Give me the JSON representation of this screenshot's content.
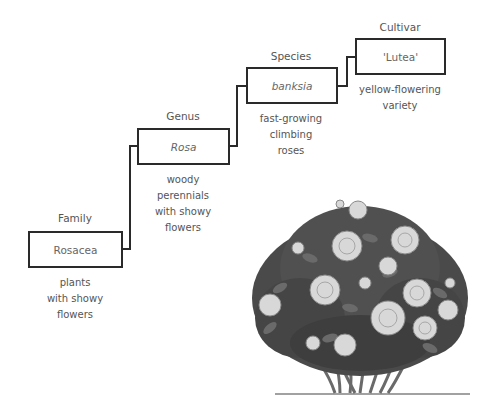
{
  "diagram": {
    "levels": [
      {
        "rank": "Family",
        "name": "Rosacea",
        "italic": false,
        "description": [
          "plants",
          "with showy",
          "flowers"
        ]
      },
      {
        "rank": "Genus",
        "name": "Rosa",
        "italic": true,
        "description": [
          "woody",
          "perennials",
          "with showy",
          "flowers"
        ]
      },
      {
        "rank": "Species",
        "name": "banksia",
        "italic": true,
        "description": [
          "fast-growing",
          "climbing",
          "roses"
        ]
      },
      {
        "rank": "Cultivar",
        "name": "'Lutea'",
        "italic": false,
        "description": [
          "yellow-flowering",
          "variety"
        ]
      }
    ],
    "illustration": "rose-bush-icon",
    "colors": {
      "box_border": "#2a2a2a",
      "connector": "#2a2a2a",
      "text": "#555555",
      "leaf_dark": "#3a3a3a",
      "leaf_mid": "#5a5a5a",
      "rose": "#d8d8d8"
    }
  }
}
